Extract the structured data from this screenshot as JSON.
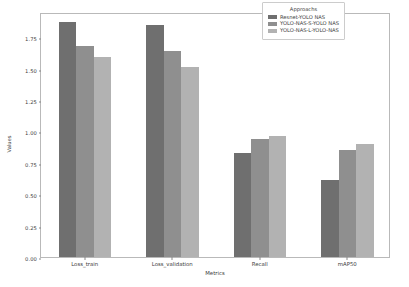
{
  "chart_data": {
    "type": "bar",
    "title": "",
    "xlabel": "Metrics",
    "ylabel": "Values",
    "categories": [
      "Loss_train",
      "Loss_validation",
      "Recall",
      "mAP50"
    ],
    "series": [
      {
        "name": "Resnet-YOLO NAS",
        "color": "#6f6f6f",
        "values": [
          1.87,
          1.85,
          0.83,
          0.61
        ]
      },
      {
        "name": "YOLO-NAS-S-YOLO NAS",
        "color": "#8f8f8f",
        "values": [
          1.68,
          1.64,
          0.94,
          0.85
        ]
      },
      {
        "name": "YOLO-NAS-L-YOLO-NAS",
        "color": "#b2b2b2",
        "values": [
          1.59,
          1.51,
          0.96,
          0.9
        ]
      }
    ],
    "ylim": [
      0.0,
      1.95
    ],
    "yticks": [
      "0.00",
      "0.25",
      "0.50",
      "0.75",
      "1.00",
      "1.25",
      "1.50",
      "1.75"
    ],
    "ytick_values": [
      0.0,
      0.25,
      0.5,
      0.75,
      1.0,
      1.25,
      1.5,
      1.75
    ],
    "grid": false,
    "legend": {
      "title": "Approachs",
      "position": "upper right"
    },
    "background_color": "#ffffff",
    "frame_color": "#b9b9b9"
  }
}
